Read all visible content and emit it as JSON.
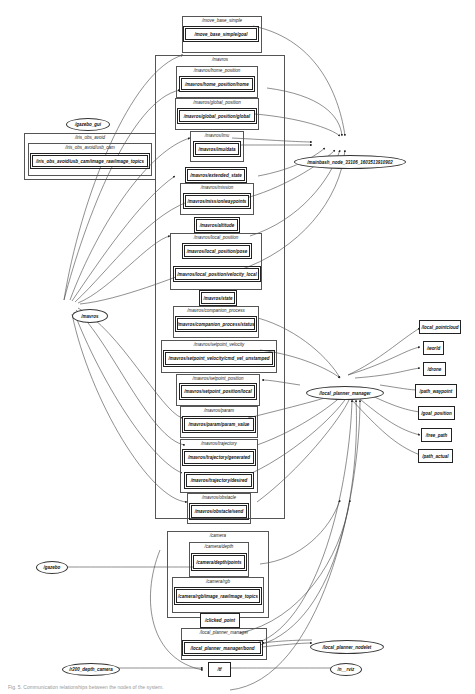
{
  "diagram": {
    "type": "rqt_graph",
    "groups": {
      "move_base_simple": "/move_base_simple",
      "mavros": "/mavros",
      "home_position": "/mavros/home_position",
      "global_position": "/mavros/global_position",
      "imu": "/mavros/imu",
      "mission": "/mavros/mission",
      "local_position": "/mavros/local_position",
      "companion_process": "/mavros/companion_process",
      "setpoint_velocity": "/mavros/setpoint_velocity",
      "setpoint_position": "/mavros/setpoint_position",
      "param": "/mavros/param",
      "trajectory": "/mavros/trajectory",
      "obstacle": "/mavros/obstacle",
      "camera": "/camera",
      "camera_depth": "/camera/depth",
      "camera_rgb": "/camera/rgb",
      "local_planner_manager_grp": "/local_planner_manager",
      "iris_obs_avoid": "/iris_obs_avoid",
      "usb_cam": "/iris_obs_avoid/usb_cam"
    },
    "topics": {
      "goal": "/move_base_simple/goal",
      "home": "/mavros/home_position/home",
      "global": "/mavros/global_position/global",
      "imu_data": "/mavros/imu/data",
      "extended_state": "/mavros/extended_state",
      "waypoints": "/mavros/mission/waypoints",
      "altitude": "/mavros/altitude",
      "pose": "/mavros/local_position/pose",
      "velocity_local": "/mavros/local_position/velocity_local",
      "state": "/mavros/state",
      "status": "/mavros/companion_process/status",
      "cmd_vel": "/mavros/setpoint_velocity/cmd_vel_unstamped",
      "local": "/mavros/setpoint_position/local",
      "param_value": "/mavros/param/param_value",
      "generated": "/mavros/trajectory/generated",
      "desired": "/mavros/trajectory/desired",
      "obstacle_send": "/mavros/obstacle/send",
      "points": "/camera/depth/points",
      "image_raw": "/camera/rgb/image_raw/image_topics",
      "clicked_point": "/clicked_point",
      "bond": "/local_planner_manager/bond",
      "tf": "/tf",
      "usb_image": "/iris_obs_avoid/usb_cam/image_raw/image_topics",
      "local_pointcloud": "/local_pointcloud",
      "world": "/world",
      "drone": "/drone",
      "path_waypoint": "/path_waypoint",
      "goal_position": "/goal_position",
      "tree_path": "/tree_path",
      "path_actual": "/path_actual"
    },
    "nodes": {
      "gazebo_gui": "/gazebo_gui",
      "mainbash": "/mainbash_node_33106_1603513910902",
      "mavros": "/mavros",
      "local_planner_manager": "/local_planner_manager",
      "gazebo": "/gazebo",
      "local_planner_nodelet": "/local_planner_nodelet",
      "r200_depth_camera": "/r200_depth_camera",
      "n_rviz": "/n__rviz"
    },
    "caption": "Fig. 5. Communication relationships between the nodes of the system."
  }
}
